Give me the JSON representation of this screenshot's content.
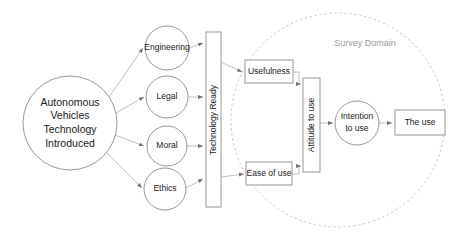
{
  "diagram": {
    "title_label": "Survey Domain",
    "nodes": {
      "source": {
        "name": "autonomous-vehicles-technology-introduced",
        "lines": [
          "Autonomous",
          "Vehicles",
          "Technology",
          "Introduced"
        ],
        "shape": "circle"
      },
      "engineering": {
        "label": "Engineering",
        "shape": "circle"
      },
      "legal": {
        "label": "Legal",
        "shape": "circle"
      },
      "moral": {
        "label": "Moral",
        "shape": "circle"
      },
      "ethics": {
        "label": "Ethics",
        "shape": "circle"
      },
      "technology_ready": {
        "label": "Technology Ready",
        "shape": "vertical-bar"
      },
      "usefulness": {
        "label": "Usefulness",
        "shape": "rectangle"
      },
      "ease_of_use": {
        "label": "Ease of use",
        "shape": "rectangle"
      },
      "attitude_to_use": {
        "label": "Attitude to use",
        "shape": "vertical-bar"
      },
      "intention_to_use": {
        "lines": [
          "Intention",
          "to use"
        ],
        "label": "Intention to use",
        "shape": "circle"
      },
      "the_use": {
        "label": "The use",
        "shape": "rectangle"
      }
    },
    "colors": {
      "shape_stroke": "#8d8d8d",
      "connector": "#b0b0b0",
      "domain_stroke": "#c2c2c2",
      "domain_label": "#9a9a9a",
      "text": "#1a1a1a",
      "background": "#ffffff"
    }
  }
}
